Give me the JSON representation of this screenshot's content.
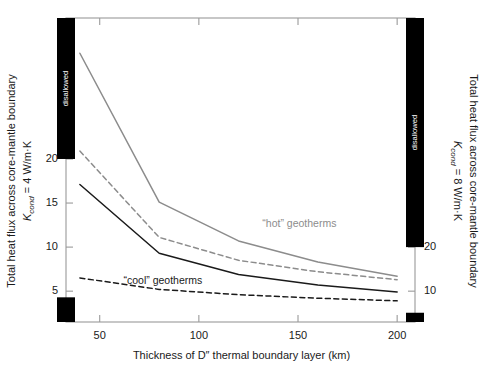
{
  "chart_data": {
    "type": "line",
    "title": "",
    "xlabel": "Thickness of D″ thermal boundary layer (km)",
    "ylabel_left_line1": "Total heat flux across core-mantle boundary",
    "ylabel_left_line2_k": "K",
    "ylabel_left_line2_sub": "cond",
    "ylabel_left_line2_rest": " = 4 W/m·K",
    "ylabel_right_line1": "Total heat flux across core-mantle boundary",
    "ylabel_right_line2_k": "K",
    "ylabel_right_line2_sub": "cond",
    "ylabel_right_line2_rest": " = 8 W/m·K",
    "xlim": [
      33,
      209
    ],
    "x_ticks": [
      50,
      100,
      150,
      200
    ],
    "x_ticklabels": [
      "50",
      "100",
      "150",
      "200"
    ],
    "ylim_left": [
      1.5,
      36
    ],
    "y_ticks_left": [
      5,
      10,
      15,
      20
    ],
    "y_ticklabels_left": [
      "5",
      "10",
      "15",
      "20"
    ],
    "ylim_right": [
      3,
      72
    ],
    "y_ticks_right": [
      10,
      20
    ],
    "y_ticklabels_right": [
      "10",
      "20"
    ],
    "grid": false,
    "legend": "inline-annotations",
    "annotations": [
      {
        "text": "“hot” geotherms",
        "color": "#8c8c8c",
        "x": 132,
        "y": 12.6
      },
      {
        "text": "“cool” geotherms",
        "color": "#1a1a1a",
        "x": 62,
        "y": 6.1
      }
    ],
    "disallowed_label": "disallowed",
    "disallowed_regions": [
      {
        "axis": "left",
        "position": "top",
        "from": 20,
        "to": 36
      },
      {
        "axis": "left",
        "position": "bottom",
        "from": 1.5,
        "to": 4.3
      },
      {
        "axis": "right",
        "position": "top",
        "from": 20,
        "to": 72
      },
      {
        "axis": "right",
        "position": "bottom",
        "from": 3,
        "to": 5.1
      }
    ],
    "series": [
      {
        "name": "hot geotherms upper",
        "color": "#8c8c8c",
        "style": "solid",
        "x": [
          40,
          80,
          120,
          160,
          200
        ],
        "y": [
          32.0,
          15.1,
          10.7,
          8.3,
          6.7
        ]
      },
      {
        "name": "hot geotherms lower",
        "color": "#8c8c8c",
        "style": "dashed",
        "x": [
          40,
          80,
          120,
          160,
          200
        ],
        "y": [
          20.9,
          11.1,
          8.5,
          7.2,
          6.3
        ]
      },
      {
        "name": "cool geotherms upper",
        "color": "#1a1a1a",
        "style": "solid",
        "x": [
          40,
          80,
          120,
          160,
          200
        ],
        "y": [
          17.1,
          9.3,
          6.9,
          5.7,
          4.9
        ]
      },
      {
        "name": "cool geotherms lower",
        "color": "#1a1a1a",
        "style": "dashed",
        "x": [
          40,
          80,
          120,
          160,
          200
        ],
        "y": [
          6.5,
          5.2,
          4.6,
          4.2,
          3.9
        ]
      }
    ]
  }
}
